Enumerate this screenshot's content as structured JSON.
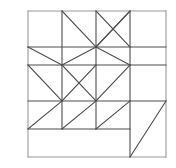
{
  "figure": {
    "title": "",
    "type": "geometric-line-drawing",
    "canvas": {
      "width": 176,
      "height": 168,
      "background": "#ffffff"
    },
    "stroke": {
      "color": "#4d4d4d",
      "light_color": "#9a9a9a",
      "width": 1.1
    },
    "bounds": {
      "x0": 28,
      "y0": 11,
      "x1": 166,
      "y1": 157
    },
    "grid": {
      "x_lines": [
        28,
        62,
        96,
        130,
        166
      ],
      "y_lines": [
        11,
        47,
        65,
        101,
        129,
        157
      ],
      "columns": 4,
      "rows": 5
    },
    "outline": [
      {
        "name": "outer-square-top",
        "x1": 28,
        "y1": 11,
        "x2": 166,
        "y2": 11
      },
      {
        "name": "outer-square-left",
        "x1": 28,
        "y1": 11,
        "x2": 28,
        "y2": 157
      },
      {
        "name": "outer-square-right",
        "x1": 166,
        "y1": 11,
        "x2": 166,
        "y2": 157
      },
      {
        "name": "outer-square-bottom",
        "x1": 28,
        "y1": 157,
        "x2": 166,
        "y2": 157
      }
    ],
    "horizontal_lines": [
      {
        "name": "h-row1-row2-left",
        "x1": 28,
        "y1": 47,
        "x2": 130,
        "y2": 47
      },
      {
        "name": "h-row1-row2-right",
        "x1": 130,
        "y1": 47,
        "x2": 166,
        "y2": 47
      },
      {
        "name": "h-row2-row3",
        "x1": 28,
        "y1": 65,
        "x2": 130,
        "y2": 65
      },
      {
        "name": "h-row2-row3-right",
        "x1": 130,
        "y1": 65,
        "x2": 166,
        "y2": 65
      },
      {
        "name": "h-row3-row4",
        "x1": 28,
        "y1": 101,
        "x2": 166,
        "y2": 101
      },
      {
        "name": "h-row4-row5",
        "x1": 28,
        "y1": 129,
        "x2": 130,
        "y2": 129
      }
    ],
    "vertical_lines": [
      {
        "name": "v-col1-col2-upper",
        "x1": 62,
        "y1": 11,
        "x2": 62,
        "y2": 129
      },
      {
        "name": "v-col2-col3-upper",
        "x1": 96,
        "y1": 11,
        "x2": 96,
        "y2": 129
      },
      {
        "name": "v-col3-col4-upper",
        "x1": 130,
        "y1": 11,
        "x2": 130,
        "y2": 101
      },
      {
        "name": "v-col3-col4-lower",
        "x1": 130,
        "y1": 101,
        "x2": 130,
        "y2": 157
      }
    ],
    "diagonals": [
      {
        "name": "diag-r1c2",
        "x1": 62,
        "y1": 11,
        "x2": 96,
        "y2": 47
      },
      {
        "name": "diag-r1c3",
        "x1": 96,
        "y1": 11,
        "x2": 130,
        "y2": 47
      },
      {
        "name": "diag-r1c4",
        "x1": 130,
        "y1": 11,
        "x2": 96,
        "y2": 47
      },
      {
        "name": "diag-r1c3b",
        "x1": 130,
        "y1": 11,
        "x2": 130,
        "y2": 11
      },
      {
        "name": "diag-r2c1",
        "x1": 28,
        "y1": 47,
        "x2": 62,
        "y2": 65
      },
      {
        "name": "diag-r2c2",
        "x1": 96,
        "y1": 47,
        "x2": 62,
        "y2": 65
      },
      {
        "name": "diag-r2c3",
        "x1": 96,
        "y1": 47,
        "x2": 130,
        "y2": 65
      },
      {
        "name": "diag-r2c4",
        "x1": 96,
        "y1": 47,
        "x2": 130,
        "y2": 11
      },
      {
        "name": "diag-r3c1",
        "x1": 28,
        "y1": 65,
        "x2": 62,
        "y2": 101
      },
      {
        "name": "diag-r3c2",
        "x1": 62,
        "y1": 101,
        "x2": 96,
        "y2": 65
      },
      {
        "name": "diag-r3c3",
        "x1": 96,
        "y1": 101,
        "x2": 130,
        "y2": 65
      },
      {
        "name": "diag-r3c2b",
        "x1": 62,
        "y1": 65,
        "x2": 96,
        "y2": 101
      },
      {
        "name": "diag-r4c1",
        "x1": 28,
        "y1": 129,
        "x2": 62,
        "y2": 101
      },
      {
        "name": "diag-r4c2",
        "x1": 62,
        "y1": 129,
        "x2": 96,
        "y2": 101
      },
      {
        "name": "diag-r4c3",
        "x1": 96,
        "y1": 129,
        "x2": 130,
        "y2": 101
      },
      {
        "name": "diag-bottom-right-triangle",
        "x1": 130,
        "y1": 157,
        "x2": 166,
        "y2": 101
      }
    ]
  }
}
